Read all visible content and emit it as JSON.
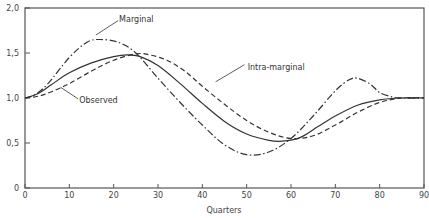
{
  "chart_data": {
    "type": "line",
    "title": "",
    "xlabel": "Quarters",
    "ylabel": "",
    "xlim": [
      0,
      90
    ],
    "ylim": [
      0,
      2.0
    ],
    "grid": false,
    "legend": "inline annotations",
    "x_ticks": [
      "0",
      "10",
      "20",
      "30",
      "40",
      "50",
      "60",
      "70",
      "80",
      "90"
    ],
    "y_ticks": [
      "0",
      "0.5",
      "1.0",
      "1.5",
      "2.0"
    ],
    "series": [
      {
        "name": "Marginal",
        "style": "dash-dot",
        "x": [
          0,
          2,
          5,
          10,
          14,
          17,
          21,
          25,
          30,
          35,
          40,
          45,
          50,
          55,
          60,
          65,
          70,
          73,
          75,
          78,
          80,
          83,
          85,
          90
        ],
        "values": [
          1.0,
          1.03,
          1.15,
          1.45,
          1.62,
          1.65,
          1.62,
          1.5,
          1.22,
          0.95,
          0.7,
          0.48,
          0.37,
          0.4,
          0.55,
          0.8,
          1.08,
          1.2,
          1.22,
          1.15,
          1.06,
          1.01,
          1.0,
          1.0
        ]
      },
      {
        "name": "Observed",
        "style": "solid",
        "x": [
          0,
          3,
          6,
          10,
          15,
          20,
          23,
          26,
          30,
          35,
          40,
          45,
          50,
          55,
          58,
          62,
          66,
          70,
          75,
          80,
          85,
          90
        ],
        "values": [
          1.0,
          1.05,
          1.15,
          1.28,
          1.39,
          1.46,
          1.48,
          1.46,
          1.36,
          1.16,
          0.94,
          0.74,
          0.6,
          0.53,
          0.52,
          0.56,
          0.68,
          0.8,
          0.92,
          0.98,
          1.0,
          1.0
        ]
      },
      {
        "name": "Intra-marginal",
        "style": "dashed",
        "x": [
          0,
          3,
          6,
          10,
          15,
          20,
          25,
          28,
          32,
          36,
          40,
          45,
          50,
          55,
          60,
          65,
          70,
          75,
          80,
          85,
          90
        ],
        "values": [
          1.0,
          1.02,
          1.07,
          1.16,
          1.3,
          1.42,
          1.49,
          1.48,
          1.42,
          1.3,
          1.13,
          0.93,
          0.75,
          0.62,
          0.55,
          0.58,
          0.7,
          0.84,
          0.95,
          1.0,
          1.0
        ]
      }
    ],
    "annotations": [
      {
        "text": "Marginal",
        "x": 21,
        "y": 1.88,
        "points_to": "Marginal"
      },
      {
        "text": "Intra-marginal",
        "x": 50,
        "y": 1.35,
        "points_to": "Intra-marginal"
      },
      {
        "text": "Observed",
        "x": 12,
        "y": 0.98,
        "points_to": "Observed"
      }
    ]
  }
}
